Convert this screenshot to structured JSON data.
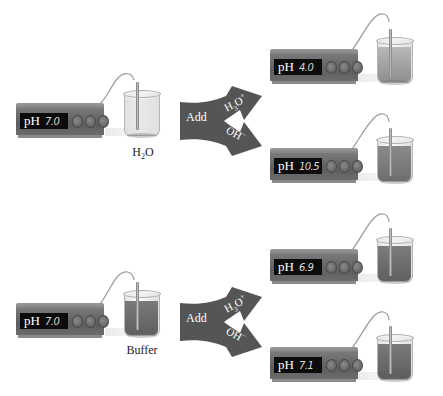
{
  "colors": {
    "meter_body": "#6a6a6a",
    "display_bg": "#0c0c0c",
    "arrow_fill": "#555555",
    "water_liquid": "#e6e6e6",
    "buffer_liquid": "#6e6e6e",
    "acid_liquid": "#9a9a9a",
    "base_liquid": "#7f7f7f"
  },
  "experiments": [
    {
      "name": "water",
      "label": "H2O",
      "label_main": "H",
      "label_sub": "2",
      "label_tail": "O",
      "initial": {
        "ph_label": "pH",
        "ph_value": "7.0"
      },
      "arrow": {
        "add_label": "Add",
        "acid_label": "H3O+",
        "base_label": "OH−"
      },
      "results": [
        {
          "added": "H3O+",
          "ph_label": "pH",
          "ph_value": "4.0"
        },
        {
          "added": "OH−",
          "ph_label": "pH",
          "ph_value": "10.5"
        }
      ]
    },
    {
      "name": "buffer",
      "label": "Buffer",
      "initial": {
        "ph_label": "pH",
        "ph_value": "7.0"
      },
      "arrow": {
        "add_label": "Add",
        "acid_label": "H3O+",
        "base_label": "OH−"
      },
      "results": [
        {
          "added": "H3O+",
          "ph_label": "pH",
          "ph_value": "6.9"
        },
        {
          "added": "OH−",
          "ph_label": "pH",
          "ph_value": "7.1"
        }
      ]
    }
  ]
}
